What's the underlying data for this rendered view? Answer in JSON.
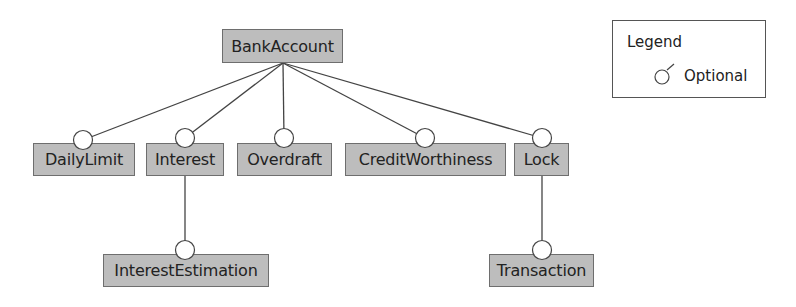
{
  "diagram": {
    "type": "feature-model",
    "root": {
      "id": "root",
      "label": "BankAccount"
    },
    "features": [
      {
        "id": "daily_limit",
        "label": "DailyLimit",
        "parent": "root",
        "kind": "optional"
      },
      {
        "id": "interest",
        "label": "Interest",
        "parent": "root",
        "kind": "optional"
      },
      {
        "id": "overdraft",
        "label": "Overdraft",
        "parent": "root",
        "kind": "optional"
      },
      {
        "id": "credit_worthiness",
        "label": "CreditWorthiness",
        "parent": "root",
        "kind": "optional"
      },
      {
        "id": "lock",
        "label": "Lock",
        "parent": "root",
        "kind": "optional"
      },
      {
        "id": "interest_estimation",
        "label": "InterestEstimation",
        "parent": "interest",
        "kind": "optional"
      },
      {
        "id": "transaction",
        "label": "Transaction",
        "parent": "lock",
        "kind": "optional"
      }
    ],
    "edges": [
      {
        "from": "BankAccount",
        "to": "DailyLimit",
        "kind": "optional"
      },
      {
        "from": "BankAccount",
        "to": "Interest",
        "kind": "optional"
      },
      {
        "from": "BankAccount",
        "to": "Overdraft",
        "kind": "optional"
      },
      {
        "from": "BankAccount",
        "to": "CreditWorthiness",
        "kind": "optional"
      },
      {
        "from": "BankAccount",
        "to": "Lock",
        "kind": "optional"
      },
      {
        "from": "Interest",
        "to": "InterestEstimation",
        "kind": "optional"
      },
      {
        "from": "Lock",
        "to": "Transaction",
        "kind": "optional"
      }
    ]
  },
  "legend": {
    "title": "Legend",
    "items": [
      {
        "icon": "optional-circle-icon",
        "label": "Optional"
      }
    ]
  },
  "colors": {
    "box_fill": "#bdbdbd",
    "box_border": "#6e6e6e",
    "edge": "#444444",
    "circle_fill": "#ffffff"
  }
}
